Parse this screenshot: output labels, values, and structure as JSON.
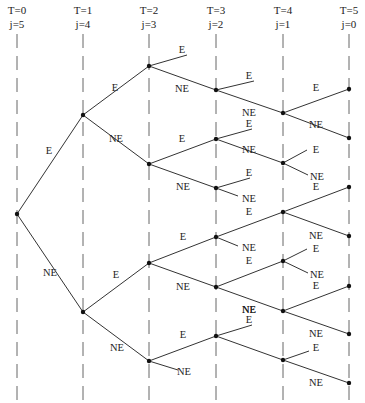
{
  "diagram": {
    "type": "binary decision tree",
    "columns": [
      {
        "T": "T=0",
        "j": "j=5",
        "x": 17
      },
      {
        "T": "T=1",
        "j": "j=4",
        "x": 83
      },
      {
        "T": "T=2",
        "j": "j=3",
        "x": 149
      },
      {
        "T": "T=3",
        "j": "j=2",
        "x": 216
      },
      {
        "T": "T=4",
        "j": "j=1",
        "x": 283
      },
      {
        "T": "T=5",
        "j": "j=0",
        "x": 349
      }
    ],
    "nodes": [
      {
        "id": "n0",
        "x": 17,
        "y": 214
      },
      {
        "id": "n1a",
        "x": 83,
        "y": 115
      },
      {
        "id": "n1b",
        "x": 83,
        "y": 312
      },
      {
        "id": "n2a",
        "x": 149,
        "y": 66
      },
      {
        "id": "n2b",
        "x": 149,
        "y": 164
      },
      {
        "id": "n2c",
        "x": 149,
        "y": 263
      },
      {
        "id": "n2d",
        "x": 149,
        "y": 361
      },
      {
        "id": "n3a",
        "x": 216,
        "y": 90
      },
      {
        "id": "n3b",
        "x": 216,
        "y": 139
      },
      {
        "id": "n3c",
        "x": 216,
        "y": 188
      },
      {
        "id": "n3d",
        "x": 216,
        "y": 237
      },
      {
        "id": "n3e",
        "x": 216,
        "y": 287
      },
      {
        "id": "n3f",
        "x": 216,
        "y": 336
      },
      {
        "id": "n4a",
        "x": 283,
        "y": 113
      },
      {
        "id": "n4b",
        "x": 283,
        "y": 163
      },
      {
        "id": "n4c",
        "x": 283,
        "y": 212
      },
      {
        "id": "n4d",
        "x": 283,
        "y": 261
      },
      {
        "id": "n4e",
        "x": 283,
        "y": 311
      },
      {
        "id": "n4f",
        "x": 283,
        "y": 360
      },
      {
        "id": "n5a",
        "x": 349,
        "y": 89
      },
      {
        "id": "n5b",
        "x": 349,
        "y": 138
      },
      {
        "id": "n5c",
        "x": 349,
        "y": 187
      },
      {
        "id": "n5d",
        "x": 349,
        "y": 236
      },
      {
        "id": "n5e",
        "x": 349,
        "y": 286
      },
      {
        "id": "n5f",
        "x": 349,
        "y": 334
      },
      {
        "id": "n5g",
        "x": 349,
        "y": 383
      }
    ],
    "edges": [
      {
        "x1": 17,
        "y1": 214,
        "x2": 83,
        "y2": 115,
        "label": "E",
        "lx": 49,
        "ly": 154
      },
      {
        "x1": 17,
        "y1": 214,
        "x2": 83,
        "y2": 312,
        "label": "NE",
        "lx": 50,
        "ly": 276
      },
      {
        "x1": 83,
        "y1": 115,
        "x2": 149,
        "y2": 66,
        "label": "E",
        "lx": 115,
        "ly": 91
      },
      {
        "x1": 83,
        "y1": 115,
        "x2": 149,
        "y2": 164,
        "label": "NE",
        "lx": 116,
        "ly": 142
      },
      {
        "x1": 83,
        "y1": 312,
        "x2": 149,
        "y2": 263,
        "label": "E",
        "lx": 116,
        "ly": 278
      },
      {
        "x1": 83,
        "y1": 312,
        "x2": 149,
        "y2": 361,
        "label": "NE",
        "lx": 117,
        "ly": 351
      },
      {
        "x1": 149,
        "y1": 66,
        "x2": 187,
        "y2": 55,
        "label": "E",
        "lx": 182,
        "ly": 53
      },
      {
        "x1": 149,
        "y1": 66,
        "x2": 216,
        "y2": 90,
        "label": "NE",
        "lx": 182,
        "ly": 92
      },
      {
        "x1": 149,
        "y1": 164,
        "x2": 216,
        "y2": 139,
        "label": "E",
        "lx": 182,
        "ly": 142
      },
      {
        "x1": 149,
        "y1": 164,
        "x2": 216,
        "y2": 188,
        "label": "NE",
        "lx": 183,
        "ly": 190
      },
      {
        "x1": 149,
        "y1": 263,
        "x2": 216,
        "y2": 237,
        "label": "E",
        "lx": 183,
        "ly": 240
      },
      {
        "x1": 149,
        "y1": 263,
        "x2": 216,
        "y2": 287,
        "label": "NE",
        "lx": 183,
        "ly": 290
      },
      {
        "x1": 149,
        "y1": 361,
        "x2": 216,
        "y2": 336,
        "label": "E",
        "lx": 183,
        "ly": 338
      },
      {
        "x1": 149,
        "y1": 361,
        "x2": 178,
        "y2": 370,
        "label": "NE",
        "lx": 184,
        "ly": 375
      },
      {
        "x1": 216,
        "y1": 90,
        "x2": 254,
        "y2": 81,
        "label": "E",
        "lx": 249,
        "ly": 79
      },
      {
        "x1": 216,
        "y1": 90,
        "x2": 283,
        "y2": 113,
        "label": "NE",
        "lx": 249,
        "ly": 116
      },
      {
        "x1": 216,
        "y1": 139,
        "x2": 252,
        "y2": 129,
        "label": "E",
        "lx": 249,
        "ly": 127
      },
      {
        "x1": 216,
        "y1": 139,
        "x2": 283,
        "y2": 163,
        "label": "NE",
        "lx": 249,
        "ly": 153
      },
      {
        "x1": 216,
        "y1": 188,
        "x2": 250,
        "y2": 178,
        "label": "E",
        "lx": 249,
        "ly": 176
      },
      {
        "x1": 216,
        "y1": 188,
        "x2": 238,
        "y2": 196,
        "label": "NE",
        "lx": 249,
        "ly": 202
      },
      {
        "x1": 216,
        "y1": 237,
        "x2": 283,
        "y2": 212,
        "label": "E",
        "lx": 249,
        "ly": 215
      },
      {
        "x1": 216,
        "y1": 237,
        "x2": 238,
        "y2": 246,
        "label": "NE",
        "lx": 249,
        "ly": 251
      },
      {
        "x1": 216,
        "y1": 287,
        "x2": 283,
        "y2": 261,
        "label": "E",
        "lx": 249,
        "ly": 264
      },
      {
        "x1": 216,
        "y1": 287,
        "x2": 283,
        "y2": 311,
        "label": "NE",
        "lx": 249,
        "ly": 313
      },
      {
        "x1": 216,
        "y1": 336,
        "x2": 252,
        "y2": 325,
        "label": "E",
        "lx": 249,
        "ly": 323
      },
      {
        "x1": 216,
        "y1": 336,
        "x2": 283,
        "y2": 360,
        "label": "NE",
        "lx": 249,
        "ly": 313
      },
      {
        "x1": 283,
        "y1": 113,
        "x2": 349,
        "y2": 89,
        "label": "E",
        "lx": 316,
        "ly": 91
      },
      {
        "x1": 283,
        "y1": 113,
        "x2": 349,
        "y2": 138,
        "label": "NE",
        "lx": 316,
        "ly": 128
      },
      {
        "x1": 283,
        "y1": 163,
        "x2": 307,
        "y2": 150,
        "label": "E",
        "lx": 316,
        "ly": 153
      },
      {
        "x1": 283,
        "y1": 163,
        "x2": 308,
        "y2": 175,
        "label": "NE",
        "lx": 317,
        "ly": 180
      },
      {
        "x1": 283,
        "y1": 212,
        "x2": 349,
        "y2": 187,
        "label": "E",
        "lx": 316,
        "ly": 190
      },
      {
        "x1": 283,
        "y1": 212,
        "x2": 349,
        "y2": 236,
        "label": "NE",
        "lx": 316,
        "ly": 239
      },
      {
        "x1": 283,
        "y1": 261,
        "x2": 307,
        "y2": 249,
        "label": "E",
        "lx": 316,
        "ly": 252
      },
      {
        "x1": 283,
        "y1": 261,
        "x2": 308,
        "y2": 273,
        "label": "NE",
        "lx": 317,
        "ly": 278
      },
      {
        "x1": 283,
        "y1": 311,
        "x2": 349,
        "y2": 286,
        "label": "E",
        "lx": 316,
        "ly": 289
      },
      {
        "x1": 283,
        "y1": 311,
        "x2": 349,
        "y2": 334,
        "label": "NE",
        "lx": 316,
        "ly": 337
      },
      {
        "x1": 283,
        "y1": 360,
        "x2": 309,
        "y2": 351,
        "label": "E",
        "lx": 316,
        "ly": 351
      },
      {
        "x1": 283,
        "y1": 360,
        "x2": 349,
        "y2": 383,
        "label": "NE",
        "lx": 316,
        "ly": 386
      }
    ]
  }
}
